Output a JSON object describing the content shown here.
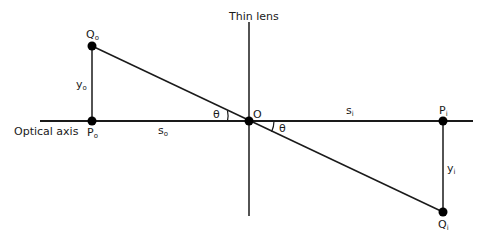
{
  "diagram": {
    "lens_label": "Thin lens",
    "axis_label": "Optical axis",
    "points": {
      "Qo": {
        "base": "Q",
        "sub": "o"
      },
      "Po": {
        "base": "P",
        "sub": "o"
      },
      "O": {
        "base": "O",
        "sub": ""
      },
      "Pi": {
        "base": "P",
        "sub": "i"
      },
      "Qi": {
        "base": "Q",
        "sub": "i"
      }
    },
    "distances": {
      "so": {
        "base": "s",
        "sub": "o"
      },
      "si": {
        "base": "s",
        "sub": "i"
      },
      "yo": {
        "base": "y",
        "sub": "o"
      },
      "yi": {
        "base": "y",
        "sub": "i"
      }
    },
    "angle_label": "θ",
    "colors": {
      "line": "#1a1a1a",
      "background": "#ffffff"
    }
  }
}
